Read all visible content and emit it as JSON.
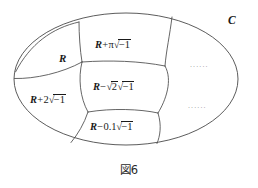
{
  "figure": {
    "caption": "図6",
    "ambient_set_label": "C",
    "subgroup_label": "R",
    "cells": [
      {
        "id": "coset-pi",
        "base": "R",
        "operator": "+",
        "coefficient": "π",
        "imaginary_unit_sign": "−",
        "imaginary_unit_radicand": "1",
        "text": "R+π√−1"
      },
      {
        "id": "coset-sqrt2",
        "base": "R",
        "operator": "−",
        "coefficient": "√2",
        "imaginary_unit_sign": "−",
        "imaginary_unit_radicand": "1",
        "text": "R−√2√−1"
      },
      {
        "id": "coset-0-1",
        "base": "R",
        "operator": "−",
        "coefficient": "0.1",
        "imaginary_unit_sign": "−",
        "imaginary_unit_radicand": "1",
        "text": "R−0.1√−1"
      },
      {
        "id": "coset-2",
        "base": "R",
        "operator": "+",
        "coefficient": "2",
        "imaginary_unit_sign": "−",
        "imaginary_unit_radicand": "1",
        "text": "R+2√−1"
      }
    ],
    "ellipses_marks": [
      "......",
      "......"
    ],
    "colors": {
      "stroke": "#4a4a4a",
      "text": "#1a1a1a",
      "ellipsis": "#9a9a9a",
      "background": "#ffffff"
    }
  }
}
